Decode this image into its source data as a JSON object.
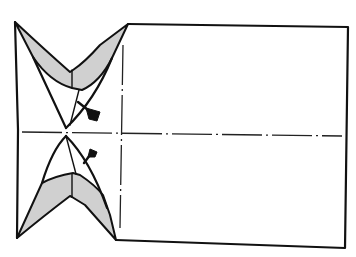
{
  "diagram": {
    "type": "origami-fold-step",
    "colors": {
      "line": "#111111",
      "shade": "#d0d0d0",
      "background": "#ffffff"
    },
    "elements": [
      {
        "name": "paper-rectangle",
        "description": "right rectangular section of paper"
      },
      {
        "name": "left-edge",
        "description": "left vertical edge"
      },
      {
        "name": "top-flap",
        "description": "shaded V-shaped flap at top-left"
      },
      {
        "name": "bottom-flap",
        "description": "shaded V-shaped flap at bottom-left"
      },
      {
        "name": "horizontal-crease",
        "description": "dash-dot horizontal center crease"
      },
      {
        "name": "vertical-crease",
        "description": "dash-dot vertical crease near flaps"
      },
      {
        "name": "push-arrow-top",
        "description": "push/sink arrow pointing to upper point"
      },
      {
        "name": "push-arrow-bottom",
        "description": "push/sink arrow pointing to lower point"
      }
    ]
  }
}
